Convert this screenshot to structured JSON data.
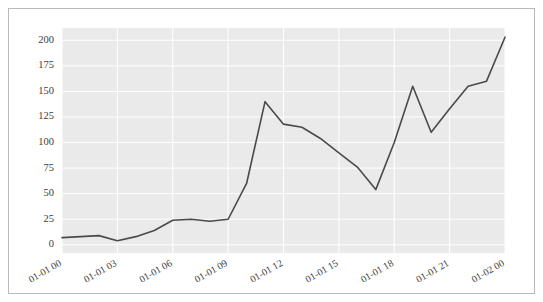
{
  "figure": {
    "background_color": "#ffffff",
    "border_color": "#b9b9b9",
    "plot_background_color": "#eaeaea",
    "gridline_color": "#ffffff",
    "line_color": "#4a4a4a",
    "tick_label_color": "#3c3c3c"
  },
  "chart_data": {
    "type": "line",
    "title": "",
    "subtitle": "",
    "xlabel": "",
    "ylabel": "",
    "x": [
      "01-01 00",
      "01-01 01",
      "01-01 02",
      "01-01 03",
      "01-01 04",
      "01-01 05",
      "01-01 06",
      "01-01 07",
      "01-01 08",
      "01-01 09",
      "01-01 10",
      "01-01 11",
      "01-01 12",
      "01-01 13",
      "01-01 14",
      "01-01 15",
      "01-01 16",
      "01-01 17",
      "01-01 18",
      "01-01 19",
      "01-01 20",
      "01-01 21",
      "01-01 22",
      "01-01 23",
      "01-02 00"
    ],
    "values": [
      7,
      8,
      9,
      4,
      8,
      14,
      24,
      25,
      23,
      25,
      60,
      140,
      118,
      115,
      104,
      90,
      76,
      54,
      100,
      155,
      110,
      133,
      155,
      160,
      203
    ],
    "xtick_labels": [
      "01-01 00",
      "01-01 03",
      "01-01 06",
      "01-01 09",
      "01-01 12",
      "01-01 15",
      "01-01 18",
      "01-01 21",
      "01-02 00"
    ],
    "xtick_rotation_degrees": -30,
    "ytick_labels": [
      "0",
      "25",
      "50",
      "75",
      "100",
      "125",
      "150",
      "175",
      "200"
    ],
    "ytick_values": [
      0,
      25,
      50,
      75,
      100,
      125,
      150,
      175,
      200
    ],
    "ylim": [
      -8,
      212
    ],
    "xlim": [
      0,
      24
    ],
    "grid": true,
    "grid_axis": "both",
    "legend": null,
    "legend_position": "none",
    "series": [
      {
        "name": "series-1",
        "color": "#4a4a4a",
        "values": [
          7,
          8,
          9,
          4,
          8,
          14,
          24,
          25,
          23,
          25,
          60,
          140,
          118,
          115,
          104,
          90,
          76,
          54,
          100,
          155,
          110,
          133,
          155,
          160,
          203
        ]
      }
    ]
  }
}
